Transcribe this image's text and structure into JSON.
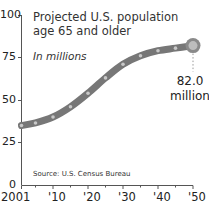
{
  "chart_data": {
    "type": "line",
    "title": "Projected U.S. population age 65 and older",
    "subtitle": "In millions",
    "source": "Source: U.S. Census Bureau",
    "xlabel": "",
    "ylabel": "",
    "x": [
      2001,
      2005,
      2010,
      2015,
      2020,
      2025,
      2030,
      2035,
      2040,
      2045,
      2050
    ],
    "series": [
      {
        "name": "Population 65+ (millions)",
        "values": [
          35,
          36.5,
          40,
          46,
          54,
          63,
          71,
          76,
          79,
          80.5,
          82
        ]
      }
    ],
    "x_tick_labels": [
      "2001",
      "'10",
      "'20",
      "'30",
      "'40",
      "'50"
    ],
    "y_tick_labels": [
      "0",
      "25",
      "50",
      "75",
      "100"
    ],
    "ylim": [
      0,
      100
    ],
    "xlim": [
      2001,
      2050
    ],
    "grid": false,
    "legend": null,
    "annotations": [
      {
        "x": 2050,
        "y": 82.0,
        "text": "82.0 million"
      }
    ],
    "colors": {
      "line": "#777777",
      "dots": "#c8c8c8",
      "axis": "#555555"
    }
  },
  "labels": {
    "title": "Projected U.S. population age 65 and older",
    "subtitle": "In millions",
    "source": "Source: U.S. Census Bureau",
    "end_value": "82.0",
    "end_unit": "million",
    "y_ticks": [
      "100",
      "75",
      "50",
      "25",
      "0"
    ],
    "x_ticks": [
      "2001",
      "'10",
      "'20",
      "'30",
      "'40",
      "'50"
    ]
  }
}
